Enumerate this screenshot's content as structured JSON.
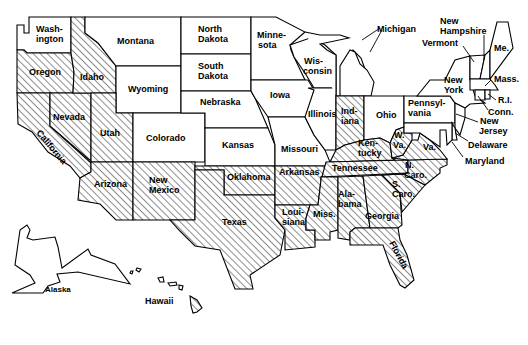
{
  "map": {
    "title": "",
    "legend": {
      "hatched_meaning": "",
      "plain_meaning": ""
    },
    "colors": {
      "stroke": "#000000",
      "background": "#ffffff",
      "hatch": "#000000"
    },
    "states": [
      {
        "id": "washington",
        "label_lines": [
          "Wash-",
          "ington"
        ],
        "hatched": false
      },
      {
        "id": "oregon",
        "label_lines": [
          "Oregon"
        ],
        "hatched": true
      },
      {
        "id": "california",
        "label_lines": [
          "California"
        ],
        "hatched": true
      },
      {
        "id": "idaho",
        "label_lines": [
          "Idaho"
        ],
        "hatched": true
      },
      {
        "id": "nevada",
        "label_lines": [
          "Nevada"
        ],
        "hatched": true
      },
      {
        "id": "montana",
        "label_lines": [
          "Montana"
        ],
        "hatched": false
      },
      {
        "id": "wyoming",
        "label_lines": [
          "Wyoming"
        ],
        "hatched": false
      },
      {
        "id": "utah",
        "label_lines": [
          "Utah"
        ],
        "hatched": true
      },
      {
        "id": "colorado",
        "label_lines": [
          "Colorado"
        ],
        "hatched": false
      },
      {
        "id": "arizona",
        "label_lines": [
          "Arizona"
        ],
        "hatched": true
      },
      {
        "id": "new-mexico",
        "label_lines": [
          "New",
          "Mexico"
        ],
        "hatched": true
      },
      {
        "id": "north-dakota",
        "label_lines": [
          "North",
          "Dakota"
        ],
        "hatched": false
      },
      {
        "id": "south-dakota",
        "label_lines": [
          "South",
          "Dakota"
        ],
        "hatched": false
      },
      {
        "id": "nebraska",
        "label_lines": [
          "Nebraska"
        ],
        "hatched": false
      },
      {
        "id": "kansas",
        "label_lines": [
          "Kansas"
        ],
        "hatched": false
      },
      {
        "id": "oklahoma",
        "label_lines": [
          "Oklahoma"
        ],
        "hatched": true
      },
      {
        "id": "texas",
        "label_lines": [
          "Texas"
        ],
        "hatched": true
      },
      {
        "id": "minnesota",
        "label_lines": [
          "Minne-",
          "sota"
        ],
        "hatched": false
      },
      {
        "id": "iowa",
        "label_lines": [
          "Iowa"
        ],
        "hatched": false
      },
      {
        "id": "missouri",
        "label_lines": [
          "Missouri"
        ],
        "hatched": false
      },
      {
        "id": "arkansas",
        "label_lines": [
          "Arkansas"
        ],
        "hatched": true
      },
      {
        "id": "louisiana",
        "label_lines": [
          "Loui-",
          "siana"
        ],
        "hatched": true
      },
      {
        "id": "wisconsin",
        "label_lines": [
          "Wis-",
          "consin"
        ],
        "hatched": false
      },
      {
        "id": "illinois",
        "label_lines": [
          "Illinois"
        ],
        "hatched": false
      },
      {
        "id": "michigan",
        "label_lines": [
          "Michigan"
        ],
        "hatched": false
      },
      {
        "id": "indiana",
        "label_lines": [
          "Ind-",
          "iana"
        ],
        "hatched": true
      },
      {
        "id": "ohio",
        "label_lines": [
          "Ohio"
        ],
        "hatched": false
      },
      {
        "id": "kentucky",
        "label_lines": [
          "Ken-",
          "tucky"
        ],
        "hatched": true
      },
      {
        "id": "tennessee",
        "label_lines": [
          "Tennessee"
        ],
        "hatched": true
      },
      {
        "id": "mississippi",
        "label_lines": [
          "Miss."
        ],
        "hatched": true
      },
      {
        "id": "alabama",
        "label_lines": [
          "Ala-",
          "bama"
        ],
        "hatched": true
      },
      {
        "id": "georgia",
        "label_lines": [
          "Georgia"
        ],
        "hatched": true
      },
      {
        "id": "florida",
        "label_lines": [
          "Florida"
        ],
        "hatched": true
      },
      {
        "id": "south-carolina",
        "label_lines": [
          "S.",
          "Caro."
        ],
        "hatched": true
      },
      {
        "id": "north-carolina",
        "label_lines": [
          "N.",
          "Caro."
        ],
        "hatched": true
      },
      {
        "id": "virginia",
        "label_lines": [
          "Va."
        ],
        "hatched": true
      },
      {
        "id": "west-virginia",
        "label_lines": [
          "W.",
          "Va."
        ],
        "hatched": true
      },
      {
        "id": "pennsylvania",
        "label_lines": [
          "Pennsyl-",
          "vania"
        ],
        "hatched": false
      },
      {
        "id": "new-york",
        "label_lines": [
          "New",
          "York"
        ],
        "hatched": false
      },
      {
        "id": "vermont",
        "label_lines": [
          "Vermont"
        ],
        "hatched": false
      },
      {
        "id": "new-hampshire",
        "label_lines": [
          "New",
          "Hampshire"
        ],
        "hatched": false
      },
      {
        "id": "maine",
        "label_lines": [
          "Me."
        ],
        "hatched": false
      },
      {
        "id": "massachusetts",
        "label_lines": [
          "Mass."
        ],
        "hatched": false
      },
      {
        "id": "rhode-island",
        "label_lines": [
          "R.I."
        ],
        "hatched": false
      },
      {
        "id": "connecticut",
        "label_lines": [
          "Conn."
        ],
        "hatched": false
      },
      {
        "id": "new-jersey",
        "label_lines": [
          "New",
          "Jersey"
        ],
        "hatched": false
      },
      {
        "id": "delaware",
        "label_lines": [
          "Delaware"
        ],
        "hatched": false
      },
      {
        "id": "maryland",
        "label_lines": [
          "Maryland"
        ],
        "hatched": false
      },
      {
        "id": "alaska",
        "label_lines": [
          "Alaska"
        ],
        "hatched": false
      },
      {
        "id": "hawaii",
        "label_lines": [
          "Hawaii"
        ],
        "hatched": true
      }
    ]
  },
  "labels": {
    "washington": [
      "Wash-",
      "ington"
    ],
    "oregon": "Oregon",
    "california": "California",
    "idaho": "Idaho",
    "nevada": "Nevada",
    "montana": "Montana",
    "wyoming": "Wyoming",
    "utah": "Utah",
    "colorado": "Colorado",
    "arizona": "Arizona",
    "new_mexico": [
      "New",
      "Mexico"
    ],
    "north_dakota": [
      "North",
      "Dakota"
    ],
    "south_dakota": [
      "South",
      "Dakota"
    ],
    "nebraska": "Nebraska",
    "kansas": "Kansas",
    "oklahoma": "Oklahoma",
    "texas": "Texas",
    "minnesota": [
      "Minne-",
      "sota"
    ],
    "iowa": "Iowa",
    "missouri": "Missouri",
    "arkansas": "Arkansas",
    "louisiana": [
      "Loui-",
      "siana"
    ],
    "wisconsin": [
      "Wis-",
      "consin"
    ],
    "illinois": "Illinois",
    "michigan": "Michigan",
    "indiana": [
      "Ind-",
      "iana"
    ],
    "ohio": "Ohio",
    "kentucky": [
      "Ken-",
      "tucky"
    ],
    "tennessee": "Tennessee",
    "mississippi": "Miss.",
    "alabama": [
      "Ala-",
      "bama"
    ],
    "georgia": "Georgia",
    "florida": "Florida",
    "south_carolina": [
      "S.",
      "Caro."
    ],
    "north_carolina": [
      "N.",
      "Caro."
    ],
    "virginia": "Va.",
    "west_virginia": [
      "W.",
      "Va."
    ],
    "pennsylvania": [
      "Pennsyl-",
      "vania"
    ],
    "new_york": [
      "New",
      "York"
    ],
    "vermont": "Vermont",
    "new_hampshire": [
      "New",
      "Hampshire"
    ],
    "maine": "Me.",
    "massachusetts": "Mass.",
    "rhode_island": "R.I.",
    "connecticut": "Conn.",
    "new_jersey": [
      "New",
      "Jersey"
    ],
    "delaware": "Delaware",
    "maryland": "Maryland",
    "alaska": "Alaska",
    "hawaii": "Hawaii"
  }
}
